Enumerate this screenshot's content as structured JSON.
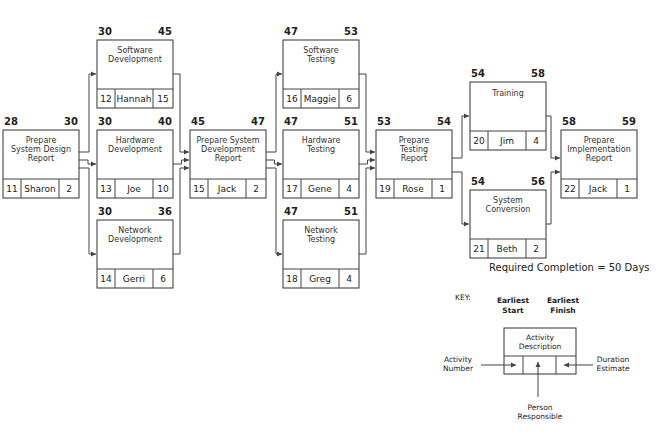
{
  "diagram": {
    "type": "network-diagram",
    "required_completion": "Required Completion = 50 Days",
    "nodes": [
      {
        "id": 11,
        "desc": [
          "Prepare",
          "System Design",
          "Report"
        ],
        "person": "Sharon",
        "duration": "2",
        "es": "28",
        "ef": "30",
        "x": 3,
        "y": 130
      },
      {
        "id": 12,
        "desc": [
          "Software",
          "Development"
        ],
        "person": "Hannah",
        "duration": "15",
        "es": "30",
        "ef": "45",
        "x": 97,
        "y": 40
      },
      {
        "id": 13,
        "desc": [
          "Hardware",
          "Development"
        ],
        "person": "Joe",
        "duration": "10",
        "es": "30",
        "ef": "40",
        "x": 97,
        "y": 130
      },
      {
        "id": 14,
        "desc": [
          "Network",
          "Development"
        ],
        "person": "Gerri",
        "duration": "6",
        "es": "30",
        "ef": "36",
        "x": 97,
        "y": 220
      },
      {
        "id": 15,
        "desc": [
          "Prepare System",
          "Development",
          "Report"
        ],
        "person": "Jack",
        "duration": "2",
        "es": "45",
        "ef": "47",
        "x": 190,
        "y": 130
      },
      {
        "id": 16,
        "desc": [
          "Software",
          "Testing"
        ],
        "person": "Maggie",
        "duration": "6",
        "es": "47",
        "ef": "53",
        "x": 283,
        "y": 40
      },
      {
        "id": 17,
        "desc": [
          "Hardware",
          "Testing"
        ],
        "person": "Gene",
        "duration": "4",
        "es": "47",
        "ef": "51",
        "x": 283,
        "y": 130
      },
      {
        "id": 18,
        "desc": [
          "Network",
          "Testing"
        ],
        "person": "Greg",
        "duration": "4",
        "es": "47",
        "ef": "51",
        "x": 283,
        "y": 220
      },
      {
        "id": 19,
        "desc": [
          "Prepare",
          "Testing",
          "Report"
        ],
        "person": "Rose",
        "duration": "1",
        "es": "53",
        "ef": "54",
        "x": 376,
        "y": 130
      },
      {
        "id": 20,
        "desc": [
          "Training"
        ],
        "person": "Jim",
        "duration": "4",
        "es": "54",
        "ef": "58",
        "x": 470,
        "y": 82
      },
      {
        "id": 21,
        "desc": [
          "System",
          "Conversion"
        ],
        "person": "Beth",
        "duration": "2",
        "es": "54",
        "ef": "56",
        "x": 470,
        "y": 190
      },
      {
        "id": 22,
        "desc": [
          "Prepare",
          "Implementation",
          "Report"
        ],
        "person": "Jack",
        "duration": "1",
        "es": "58",
        "ef": "59",
        "x": 561,
        "y": 130
      }
    ],
    "edges": [
      [
        11,
        12
      ],
      [
        11,
        13
      ],
      [
        11,
        14
      ],
      [
        12,
        15
      ],
      [
        13,
        15
      ],
      [
        14,
        15
      ],
      [
        15,
        16
      ],
      [
        15,
        17
      ],
      [
        15,
        18
      ],
      [
        16,
        19
      ],
      [
        17,
        19
      ],
      [
        18,
        19
      ],
      [
        19,
        20
      ],
      [
        19,
        21
      ],
      [
        20,
        22
      ],
      [
        21,
        22
      ]
    ],
    "key": {
      "title": "KEY:",
      "earliest_start": [
        "Earliest",
        "Start"
      ],
      "earliest_finish": [
        "Earliest",
        "Finish"
      ],
      "activity_description": [
        "Activity",
        "Description"
      ],
      "activity_number": [
        "Activity",
        "Number"
      ],
      "duration_estimate": [
        "Duration",
        "Estimate"
      ],
      "person_responsible": [
        "Person",
        "Responsible"
      ]
    },
    "colors": {
      "line": "#444444",
      "box_stroke": "#333333",
      "background": "#ffffff"
    }
  }
}
